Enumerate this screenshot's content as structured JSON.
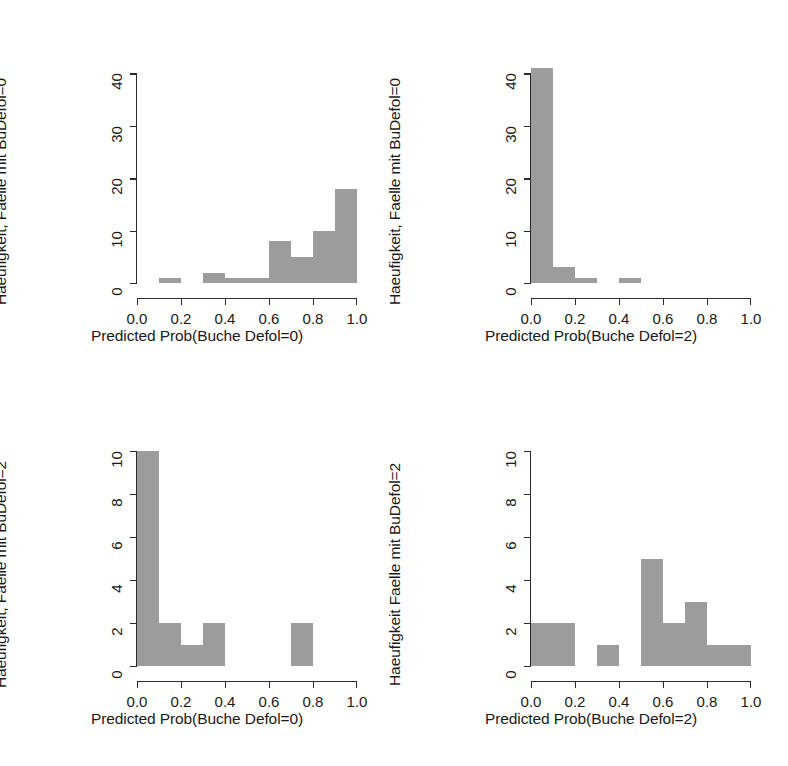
{
  "figure": {
    "background": "#ffffff",
    "bar_color": "#9c9c9c",
    "axis_color": "#2b2b2b",
    "panel_layout": "2x2"
  },
  "chart_data": [
    {
      "id": "top-left",
      "type": "bar",
      "title": "",
      "xlabel": "Predicted Prob(Buche Defol=0)",
      "ylabel": "Haeufigkeit, Faelle mit BuDefol=0",
      "xlim": [
        0.0,
        1.0
      ],
      "ylim": [
        0,
        41
      ],
      "xticks": [
        "0.0",
        "0.2",
        "0.4",
        "0.6",
        "0.8",
        "1.0"
      ],
      "xtick_values": [
        0.0,
        0.2,
        0.4,
        0.6,
        0.8,
        1.0
      ],
      "yticks": [
        "0",
        "10",
        "20",
        "30",
        "40"
      ],
      "ytick_values": [
        0,
        10,
        20,
        30,
        40
      ],
      "bin_width": 0.1,
      "bin_starts": [
        0.1,
        0.3,
        0.4,
        0.5,
        0.6,
        0.7,
        0.8,
        0.9
      ],
      "values": [
        1,
        2,
        1,
        1,
        8,
        5,
        10,
        18
      ],
      "grid": false,
      "legend": "none"
    },
    {
      "id": "top-right",
      "type": "bar",
      "title": "",
      "xlabel": "Predicted Prob(Buche Defol=2)",
      "ylabel": "Haeufigkeit, Faelle mit BuDefol=0",
      "xlim": [
        0.0,
        1.0
      ],
      "ylim": [
        0,
        41
      ],
      "xticks": [
        "0.0",
        "0.2",
        "0.4",
        "0.6",
        "0.8",
        "1.0"
      ],
      "xtick_values": [
        0.0,
        0.2,
        0.4,
        0.6,
        0.8,
        1.0
      ],
      "yticks": [
        "0",
        "10",
        "20",
        "30",
        "40"
      ],
      "ytick_values": [
        0,
        10,
        20,
        30,
        40
      ],
      "bin_width": 0.1,
      "bin_starts": [
        0.0,
        0.1,
        0.2,
        0.4
      ],
      "values": [
        41,
        3,
        1,
        1
      ],
      "grid": false,
      "legend": "none"
    },
    {
      "id": "bottom-left",
      "type": "bar",
      "title": "",
      "xlabel": "Predicted Prob(Buche Defol=0)",
      "ylabel": "Haeufigkeit, Faelle mit BuDefol=2",
      "xlim": [
        0.0,
        1.0
      ],
      "ylim": [
        0,
        10
      ],
      "xticks": [
        "0.0",
        "0.2",
        "0.4",
        "0.6",
        "0.8",
        "1.0"
      ],
      "xtick_values": [
        0.0,
        0.2,
        0.4,
        0.6,
        0.8,
        1.0
      ],
      "yticks": [
        "0",
        "2",
        "4",
        "6",
        "8",
        "10"
      ],
      "ytick_values": [
        0,
        2,
        4,
        6,
        8,
        10
      ],
      "bin_width": 0.1,
      "bin_starts": [
        0.0,
        0.1,
        0.2,
        0.3,
        0.7
      ],
      "values": [
        10,
        2,
        1,
        2,
        2
      ],
      "grid": false,
      "legend": "none"
    },
    {
      "id": "bottom-right",
      "type": "bar",
      "title": "",
      "xlabel": "Predicted Prob(Buche Defol=2)",
      "ylabel": "Haeufigkeit Faelle mit BuDefol=2",
      "xlim": [
        0.0,
        1.0
      ],
      "ylim": [
        0,
        10
      ],
      "xticks": [
        "0.0",
        "0.2",
        "0.4",
        "0.6",
        "0.8",
        "1.0"
      ],
      "xtick_values": [
        0.0,
        0.2,
        0.4,
        0.6,
        0.8,
        1.0
      ],
      "yticks": [
        "0",
        "2",
        "4",
        "6",
        "8",
        "10"
      ],
      "ytick_values": [
        0,
        2,
        4,
        6,
        8,
        10
      ],
      "bin_width": 0.1,
      "bin_starts": [
        0.0,
        0.1,
        0.3,
        0.5,
        0.6,
        0.7,
        0.8,
        0.9
      ],
      "values": [
        2,
        2,
        1,
        5,
        2,
        3,
        1,
        1
      ],
      "grid": false,
      "legend": "none"
    }
  ]
}
